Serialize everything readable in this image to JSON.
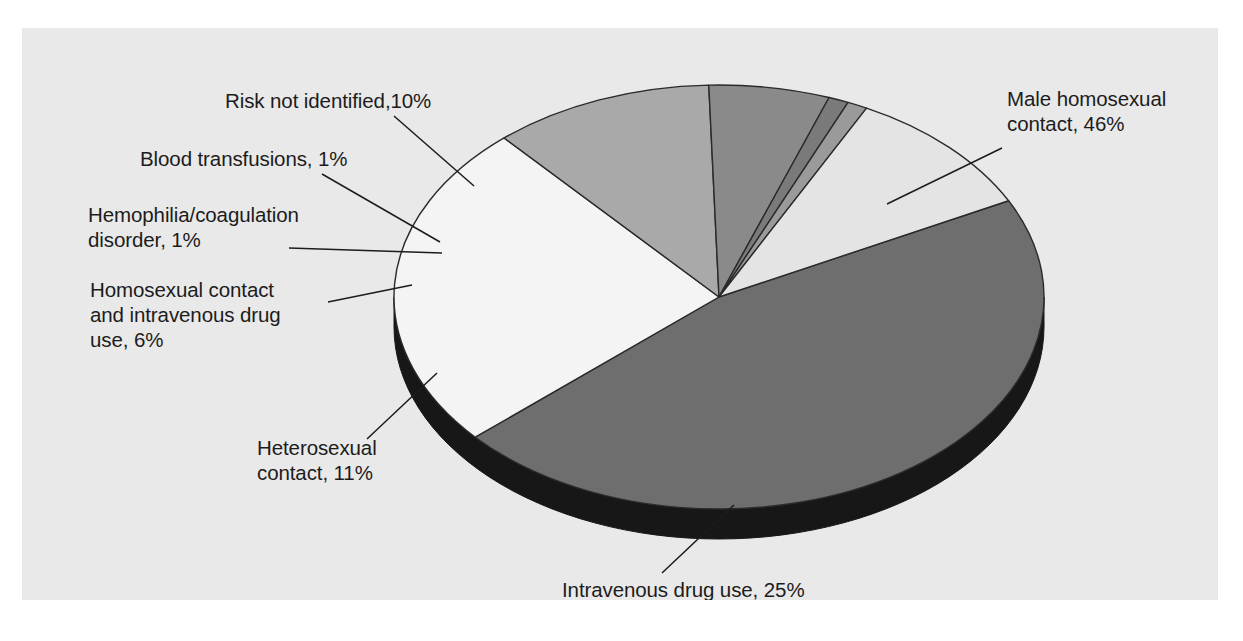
{
  "figure": {
    "title_fragment": "",
    "panel_bg": "#e9e9e9",
    "page_bg": "#ffffff"
  },
  "chart_data": {
    "type": "pie",
    "title": "",
    "subtitle": "",
    "xlabel": "",
    "ylabel": "",
    "unit": "%",
    "legend_position": "none",
    "grid": false,
    "style": "3d-pie-with-base-rim",
    "total": 100,
    "categories": [
      "Male homosexual contact",
      "Intravenous drug use",
      "Heterosexual contact",
      "Homosexual contact and intravenous drug use",
      "Hemophilia/coagulation disorder",
      "Blood transfusions",
      "Risk not identified"
    ],
    "values": [
      46,
      25,
      11,
      6,
      1,
      1,
      10
    ],
    "colors": [
      "#6e6e6e",
      "#f4f4f4",
      "#a9a9a9",
      "#8a8a8a",
      "#7a7a7a",
      "#9a9a9a",
      "#e4e4e4"
    ],
    "slices": [
      {
        "name": "male-homosexual-contact",
        "label": "Male homosexual\ncontact, 46%",
        "value": 46,
        "color": "#6e6e6e",
        "label_x": 985,
        "label_y": 58,
        "leader": {
          "x1": 980,
          "y1": 120,
          "x2": 865,
          "y2": 176
        }
      },
      {
        "name": "intravenous-drug-use",
        "label": "Intravenous drug use, 25%",
        "value": 25,
        "color": "#f4f4f4",
        "label_x": 540,
        "label_y": 549,
        "leader": {
          "x1": 640,
          "y1": 545,
          "x2": 712,
          "y2": 477
        }
      },
      {
        "name": "heterosexual-contact",
        "label": "Heterosexual\ncontact, 11%",
        "value": 11,
        "color": "#a9a9a9",
        "label_x": 235,
        "label_y": 407,
        "leader": {
          "x1": 345,
          "y1": 411,
          "x2": 415,
          "y2": 345
        }
      },
      {
        "name": "homosexual-contact-and-iv-drug-use",
        "label": "Homosexual contact\nand intravenous drug\nuse, 6%",
        "value": 6,
        "color": "#8a8a8a",
        "label_x": 68,
        "label_y": 249,
        "leader": {
          "x1": 306,
          "y1": 274,
          "x2": 390,
          "y2": 257
        }
      },
      {
        "name": "hemophilia-coagulation-disorder",
        "label": "Hemophilia/coagulation\ndisorder, 1%",
        "value": 1,
        "color": "#7a7a7a",
        "label_x": 66,
        "label_y": 174,
        "leader": {
          "x1": 267,
          "y1": 220,
          "x2": 420,
          "y2": 225
        }
      },
      {
        "name": "blood-transfusions",
        "label": "Blood transfusions, 1%",
        "value": 1,
        "color": "#9a9a9a",
        "label_x": 118,
        "label_y": 118,
        "leader": {
          "x1": 300,
          "y1": 146,
          "x2": 418,
          "y2": 214
        }
      },
      {
        "name": "risk-not-identified",
        "label": "Risk not identified,10%",
        "value": 10,
        "color": "#e4e4e4",
        "label_x": 203,
        "label_y": 60,
        "leader": {
          "x1": 372,
          "y1": 88,
          "x2": 452,
          "y2": 158
        }
      }
    ],
    "geometry": {
      "center_x": 697,
      "center_y": 269,
      "radius_x": 325,
      "radius_y": 212,
      "depth": 30,
      "start_angle_deg": -27
    }
  }
}
